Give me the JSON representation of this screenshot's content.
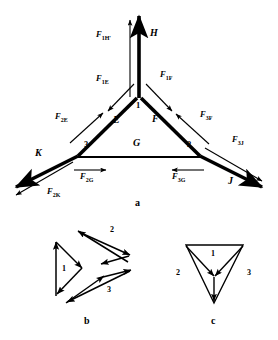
{
  "figure": {
    "type": "force-diagram"
  },
  "panels": [
    {
      "id": "a",
      "label": "a"
    },
    {
      "id": "b",
      "label": "b"
    },
    {
      "id": "c",
      "label": "c"
    }
  ],
  "panel_a": {
    "nodes": [
      {
        "name": "node-1",
        "label": "1"
      },
      {
        "name": "node-2",
        "label": "2"
      },
      {
        "name": "node-3",
        "label": "3"
      }
    ],
    "members": [
      {
        "name": "member-H",
        "label": "H"
      },
      {
        "name": "member-E",
        "label": "E"
      },
      {
        "name": "member-F",
        "label": "F"
      },
      {
        "name": "member-G",
        "label": "G"
      },
      {
        "name": "member-K",
        "label": "K"
      },
      {
        "name": "member-J",
        "label": "J"
      }
    ],
    "forces": [
      {
        "name": "force-1H",
        "base": "F",
        "sub": "1H'"
      },
      {
        "name": "force-1E",
        "base": "F",
        "sub": "1E"
      },
      {
        "name": "force-1F",
        "base": "F",
        "sub": "1F"
      },
      {
        "name": "force-2E",
        "base": "F",
        "sub": "2E"
      },
      {
        "name": "force-3F",
        "base": "F",
        "sub": "3F"
      },
      {
        "name": "force-3J",
        "base": "F",
        "sub": "3J"
      },
      {
        "name": "force-2K",
        "base": "F",
        "sub": "2K"
      },
      {
        "name": "force-2G",
        "base": "F",
        "sub": "2G"
      },
      {
        "name": "force-3G",
        "base": "F",
        "sub": "3G"
      }
    ]
  },
  "panel_b": {
    "triangles": [
      {
        "name": "triangle-1",
        "label": "1"
      },
      {
        "name": "triangle-2",
        "label": "2"
      },
      {
        "name": "triangle-3",
        "label": "3"
      }
    ]
  },
  "panel_c": {
    "vertices": [
      {
        "name": "polygon-label-1",
        "label": "1"
      },
      {
        "name": "polygon-label-2",
        "label": "2"
      },
      {
        "name": "polygon-label-3",
        "label": "3"
      }
    ]
  },
  "colors": {
    "ink": "#000000",
    "background": "#ffffff"
  }
}
